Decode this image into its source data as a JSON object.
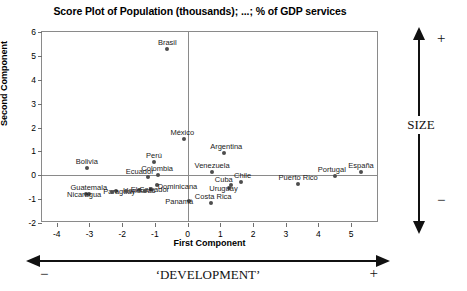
{
  "chart_data": {
    "type": "scatter",
    "title": "Score Plot of Population (thousands); ...; % of GDP services",
    "xlabel": "First Component",
    "ylabel": "Second Component",
    "xlim": [
      -4.45,
      5.85
    ],
    "ylim": [
      -2.0,
      6.0
    ],
    "xticks": [
      -4,
      -3,
      -2,
      -1,
      0,
      1,
      2,
      3,
      4,
      5
    ],
    "yticks": [
      -2,
      -1,
      0,
      1,
      2,
      3,
      4,
      5,
      6
    ],
    "grid": false,
    "legend": null,
    "reference_lines": {
      "vertical_x": 0,
      "horizontal_y": 0
    },
    "points": [
      {
        "label": "Brasil",
        "x": -0.62,
        "y": 5.28,
        "label_dx": 0,
        "label_dy": -11
      },
      {
        "label": "México",
        "x": -0.1,
        "y": 1.5,
        "label_dx": -2,
        "label_dy": -11
      },
      {
        "label": "Argentina",
        "x": 1.12,
        "y": 0.92,
        "label_dx": 2,
        "label_dy": -11
      },
      {
        "label": "Perú",
        "x": -1.03,
        "y": 0.55,
        "label_dx": 0,
        "label_dy": -11
      },
      {
        "label": "Venezuela",
        "x": 0.75,
        "y": 0.14,
        "label_dx": 0,
        "label_dy": -11
      },
      {
        "label": "Bolivia",
        "x": -3.08,
        "y": 0.3,
        "label_dx": 0,
        "label_dy": -11
      },
      {
        "label": "Colombia",
        "x": -0.9,
        "y": 0.02,
        "label_dx": -1,
        "label_dy": -11
      },
      {
        "label": "Ecuador",
        "x": -1.22,
        "y": -0.06,
        "label_dx": -8,
        "label_dy": -10
      },
      {
        "label": "España",
        "x": 5.3,
        "y": 0.14,
        "label_dx": 0,
        "label_dy": -11
      },
      {
        "label": "Portugal",
        "x": 4.5,
        "y": -0.05,
        "label_dx": -3,
        "label_dy": -11
      },
      {
        "label": "Chile",
        "x": 1.62,
        "y": -0.3,
        "label_dx": 2,
        "label_dy": -11
      },
      {
        "label": "Cuba",
        "x": 1.32,
        "y": -0.42,
        "label_dx": -7,
        "label_dy": -10
      },
      {
        "label": "Puerto  Rico",
        "x": 3.38,
        "y": -0.38,
        "label_dx": 0,
        "label_dy": -11
      },
      {
        "label": "Uruguay",
        "x": 1.28,
        "y": -0.52,
        "label_dx": -6,
        "label_dy": -4
      },
      {
        "label": "Dominicana",
        "x": -0.92,
        "y": -0.4,
        "label_dx": 20,
        "label_dy": -3
      },
      {
        "label": "El Salvador",
        "x": -1.12,
        "y": -0.58,
        "label_dx": -1,
        "label_dy": -4
      },
      {
        "label": "Honduras",
        "x": -1.48,
        "y": -0.62,
        "label_dx": 0,
        "label_dy": -4
      },
      {
        "label": "Paraguay",
        "x": -2.18,
        "y": -0.68,
        "label_dx": 3,
        "label_dy": -4
      },
      {
        "label": "Costa  Rica",
        "x": 0.72,
        "y": -1.18,
        "label_dx": 2,
        "label_dy": -11
      },
      {
        "label": "Panamá",
        "x": 0.05,
        "y": -1.08,
        "label_dx": -10,
        "label_dy": -4
      },
      {
        "label": "Guatemala",
        "x": -3.02,
        "y": -0.8,
        "label_dx": 0,
        "label_dy": -11
      },
      {
        "label": "Nicaragua",
        "x": -3.1,
        "y": -0.8,
        "label_dx": -2,
        "label_dy": -4
      },
      {
        "label": "",
        "x": -2.3,
        "y": -0.7,
        "label_dx": 0,
        "label_dy": 0
      },
      {
        "label": "",
        "x": -1.88,
        "y": -0.68,
        "label_dx": 0,
        "label_dy": 0
      },
      {
        "label": "",
        "x": -1.3,
        "y": -0.64,
        "label_dx": 0,
        "label_dy": 0
      }
    ]
  },
  "annotations": {
    "size": {
      "text": "SIZE",
      "plus": "+",
      "minus": "−"
    },
    "development": {
      "text": "‘DEVELOPMENT’",
      "plus": "+",
      "minus": "−"
    }
  }
}
